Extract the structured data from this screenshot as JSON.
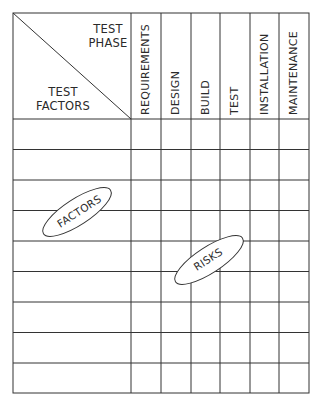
{
  "header": {
    "corner_top_label": "TEST\nPHASE",
    "corner_top_line1": "TEST",
    "corner_top_line2": "PHASE",
    "corner_bottom_line1": "TEST",
    "corner_bottom_line2": "FACTORS"
  },
  "phases": [
    "REQUIREMENTS",
    "DESIGN",
    "BUILD",
    "TEST",
    "INSTALLATION",
    "MAINTENANCE"
  ],
  "rows": {
    "count": 9
  },
  "annotations": {
    "factors_oval": "FACTORS",
    "risks_oval": "RISKS"
  },
  "colors": {
    "line": "#333333",
    "background": "#ffffff"
  }
}
